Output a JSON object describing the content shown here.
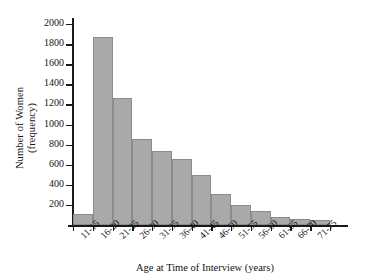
{
  "chart_data": {
    "type": "bar",
    "title": "",
    "xlabel": "Age at Time of Interview (years)",
    "ylabel_line1": "Number of Women",
    "ylabel_line2": "(frequency)",
    "categories": [
      "11-15",
      "16-20",
      "21-25",
      "26-30",
      "31-35",
      "36-40",
      "41-45",
      "46-50",
      "51-55",
      "56-60",
      "61-65",
      "66-70",
      "71-75"
    ],
    "values": [
      110,
      1875,
      1265,
      860,
      735,
      655,
      500,
      305,
      195,
      140,
      80,
      55,
      45
    ],
    "ylim": [
      0,
      2060
    ],
    "yticks": [
      200,
      400,
      600,
      800,
      1000,
      1200,
      1400,
      1600,
      1800,
      2000
    ],
    "ytick_labels": [
      "200",
      "400",
      "600",
      "800",
      "1000",
      "1200",
      "1400",
      "1600",
      "1800",
      "2000"
    ],
    "grid": false,
    "legend": "none",
    "bar_color": "#a9a9a9",
    "bar_edge_color": "#8c8c8c",
    "axis_color": "#1a1a1a",
    "background": "#ffffff"
  }
}
